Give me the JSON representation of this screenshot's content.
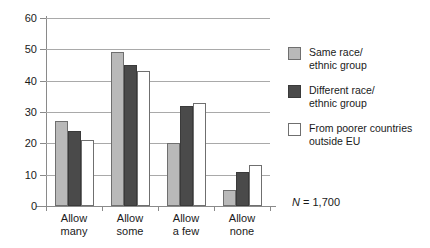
{
  "chart_data": {
    "type": "bar",
    "title": "",
    "xlabel": "",
    "ylabel": "",
    "ylim": [
      0,
      60
    ],
    "ytick_step": 10,
    "yticks": [
      "0",
      "10",
      "20",
      "30",
      "40",
      "50",
      "60"
    ],
    "grid": true,
    "legend_position": "right",
    "categories": [
      "Allow many",
      "Allow some",
      "Allow a few",
      "Allow none"
    ],
    "category_lines": [
      [
        "Allow",
        "many"
      ],
      [
        "Allow",
        "some"
      ],
      [
        "Allow",
        "a few"
      ],
      [
        "Allow",
        "none"
      ]
    ],
    "series": [
      {
        "name": "Same race/ethnic group",
        "name_lines": [
          "Same race/",
          "ethnic group"
        ],
        "color": "#b9b9b9",
        "values": [
          27,
          49,
          20,
          5
        ]
      },
      {
        "name": "Different race/ethnic group",
        "name_lines": [
          "Different race/",
          "ethnic group"
        ],
        "color": "#4a4a4a",
        "values": [
          24,
          45,
          32,
          11
        ]
      },
      {
        "name": "From poorer countries outside EU",
        "name_lines": [
          "From poorer countries",
          "outside EU"
        ],
        "color": "#ffffff",
        "values": [
          21,
          43,
          33,
          13
        ]
      }
    ],
    "annotations": [
      {
        "prefix": "N",
        "text": " = 1,700"
      }
    ]
  }
}
